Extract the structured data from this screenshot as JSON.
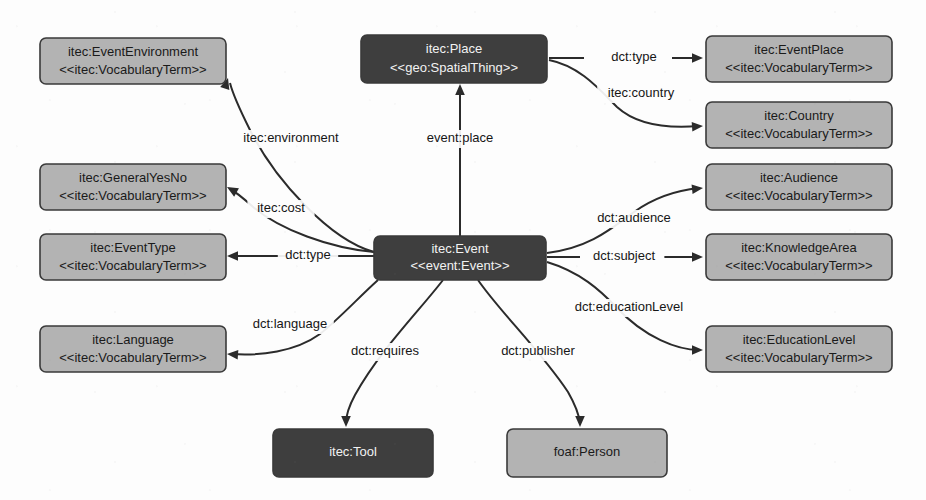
{
  "diagram": {
    "background_color": "#fdfdfd",
    "colors": {
      "node_light_fill": "#b3b3b3",
      "node_dark_fill": "#3e3e3e",
      "node_stroke": "#3a3a3a",
      "edge_stroke": "#2b2b2b",
      "text_on_light": "#1a1a1a",
      "text_on_dark": "#f2f2f2"
    },
    "nodes": [
      {
        "id": "event-environment",
        "name": "itec:EventEnvironment",
        "stereotype": "<<itec:VocabularyTerm>>",
        "style": "light",
        "x": 40,
        "y": 38,
        "w": 186,
        "h": 46
      },
      {
        "id": "place",
        "name": "itec:Place",
        "stereotype": "<<geo:SpatialThing>>",
        "style": "dark",
        "x": 361,
        "y": 35,
        "w": 186,
        "h": 48
      },
      {
        "id": "event-place",
        "name": "itec:EventPlace",
        "stereotype": "<<itec:VocabularyTerm>>",
        "style": "light",
        "x": 706,
        "y": 36,
        "w": 186,
        "h": 46
      },
      {
        "id": "country",
        "name": "itec:Country",
        "stereotype": "<<itec:VocabularyTerm>>",
        "style": "light",
        "x": 706,
        "y": 102,
        "w": 186,
        "h": 46
      },
      {
        "id": "general-yes-no",
        "name": "itec:GeneralYesNo",
        "stereotype": "<<itec:VocabularyTerm>>",
        "style": "light",
        "x": 40,
        "y": 164,
        "w": 186,
        "h": 46
      },
      {
        "id": "audience",
        "name": "itec:Audience",
        "stereotype": "<<itec:VocabularyTerm>>",
        "style": "light",
        "x": 706,
        "y": 164,
        "w": 186,
        "h": 46
      },
      {
        "id": "event-type",
        "name": "itec:EventType",
        "stereotype": "<<itec:VocabularyTerm>>",
        "style": "light",
        "x": 40,
        "y": 234,
        "w": 186,
        "h": 46
      },
      {
        "id": "event",
        "name": "itec:Event",
        "stereotype": "<<event:Event>>",
        "style": "dark",
        "x": 374,
        "y": 236,
        "w": 172,
        "h": 44
      },
      {
        "id": "knowledge-area",
        "name": "itec:KnowledgeArea",
        "stereotype": "<<itec:VocabularyTerm>>",
        "style": "light",
        "x": 706,
        "y": 234,
        "w": 186,
        "h": 46
      },
      {
        "id": "language",
        "name": "itec:Language",
        "stereotype": "<<itec:VocabularyTerm>>",
        "style": "light",
        "x": 40,
        "y": 326,
        "w": 186,
        "h": 46
      },
      {
        "id": "education-level",
        "name": "itec:EducationLevel",
        "stereotype": "<<itec:VocabularyTerm>>",
        "style": "light",
        "x": 706,
        "y": 326,
        "w": 186,
        "h": 46
      },
      {
        "id": "tool",
        "name": "itec:Tool",
        "stereotype": "",
        "style": "dark",
        "x": 273,
        "y": 429,
        "w": 160,
        "h": 48
      },
      {
        "id": "person",
        "name": "foaf:Person",
        "stereotype": "",
        "style": "light",
        "x": 507,
        "y": 429,
        "w": 160,
        "h": 48
      }
    ],
    "edges": [
      {
        "id": "edge-dct-type-place",
        "label": "dct:type",
        "from": "place",
        "to": "event-place",
        "path": "M 549 58 L 584 58 M 672 58 L 700 58",
        "label_x": 634,
        "label_y": 58,
        "arrow_x": 703,
        "arrow_y": 58,
        "arrow_angle": 0
      },
      {
        "id": "edge-itec-country",
        "label": "itec:country",
        "from": "place",
        "to": "country",
        "path": "M 549 60 C 580 66 600 90 617 107 C 640 128 675 128 699 126",
        "label_x": 641,
        "label_y": 94,
        "arrow_x": 703,
        "arrow_y": 126,
        "arrow_angle": -4
      },
      {
        "id": "edge-itec-environment",
        "label": "itec:environment",
        "from": "event",
        "to": "event-environment",
        "path": "M 374 252 C 330 240 275 180 250 130 C 240 110 233 95 230 83",
        "label_x": 291,
        "label_y": 139,
        "arrow_x": 228,
        "arrow_y": 78,
        "arrow_angle": -73
      },
      {
        "id": "edge-event-place",
        "label": "event:place",
        "from": "event",
        "to": "place",
        "path": "M 460 236 L 460 88",
        "label_x": 460,
        "label_y": 139,
        "arrow_x": 460,
        "arrow_y": 84,
        "arrow_angle": -90
      },
      {
        "id": "edge-itec-cost",
        "label": "itec:cost",
        "from": "event",
        "to": "general-yes-no",
        "path": "M 374 252 C 330 248 280 230 252 206 C 243 198 236 192 230 189",
        "label_x": 281,
        "label_y": 209,
        "arrow_x": 227,
        "arrow_y": 187,
        "arrow_angle": -150
      },
      {
        "id": "edge-dct-type-event",
        "label": "dct:type",
        "from": "event",
        "to": "event-type",
        "path": "M 374 256 L 330 256 M 287 256 L 230 256",
        "label_x": 308,
        "label_y": 256,
        "arrow_x": 227,
        "arrow_y": 256,
        "arrow_angle": 180
      },
      {
        "id": "edge-dct-audience",
        "label": "dct:audience",
        "from": "event",
        "to": "audience",
        "path": "M 547 253 C 590 248 612 228 634 212 C 655 197 680 190 699 188",
        "label_x": 634,
        "label_y": 219,
        "arrow_x": 703,
        "arrow_y": 188,
        "arrow_angle": -6
      },
      {
        "id": "edge-dct-subject",
        "label": "dct:subject",
        "from": "event",
        "to": "knowledge-area",
        "path": "M 547 257 L 580 257 M 664 257 L 700 257",
        "label_x": 624,
        "label_y": 257,
        "arrow_x": 703,
        "arrow_y": 257,
        "arrow_angle": 0
      },
      {
        "id": "edge-dct-education-level",
        "label": "dct:educationLevel",
        "from": "event",
        "to": "education-level",
        "path": "M 547 262 C 580 272 600 290 616 307 C 645 338 678 350 699 350",
        "label_x": 629,
        "label_y": 308,
        "arrow_x": 703,
        "arrow_y": 350,
        "arrow_angle": 0
      },
      {
        "id": "edge-dct-language",
        "label": "dct:language",
        "from": "event",
        "to": "language",
        "path": "M 378 280 C 358 298 340 318 320 334 C 295 352 260 356 231 354",
        "label_x": 290,
        "label_y": 325,
        "arrow_x": 227,
        "arrow_y": 354,
        "arrow_angle": 184
      },
      {
        "id": "edge-dct-requires",
        "label": "dct:requires",
        "from": "event",
        "to": "tool",
        "path": "M 443 280 C 420 310 380 350 355 395 C 348 408 346 415 346 423",
        "label_x": 385,
        "label_y": 352,
        "arrow_x": 346,
        "arrow_y": 427,
        "arrow_angle": 90
      },
      {
        "id": "edge-dct-publisher",
        "label": "dct:publisher",
        "from": "event",
        "to": "person",
        "path": "M 478 280 C 500 312 540 350 568 392 C 576 406 579 415 580 423",
        "label_x": 538,
        "label_y": 352,
        "arrow_x": 580,
        "arrow_y": 427,
        "arrow_angle": 90
      }
    ]
  }
}
